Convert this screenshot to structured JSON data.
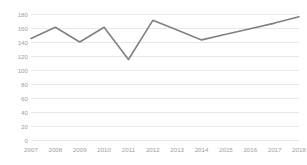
{
  "chart_data": {
    "type": "line",
    "title": "",
    "subtitle": "",
    "xlabel": "",
    "ylabel": "",
    "categories": [
      "2007",
      "2008",
      "2009",
      "2010",
      "2011",
      "2012",
      "2013",
      "2014",
      "2015",
      "2016",
      "2017",
      "2018"
    ],
    "values": [
      145,
      161,
      140,
      161,
      115,
      171,
      157,
      143,
      151,
      159,
      167,
      176
    ],
    "series": [
      {
        "name": "",
        "values": [
          145,
          161,
          140,
          161,
          115,
          171,
          157,
          143,
          151,
          159,
          167,
          176
        ]
      }
    ],
    "ylim": [
      0,
      180
    ],
    "xlim": [
      "2007",
      "2018"
    ],
    "yticks": [
      0,
      20,
      40,
      60,
      80,
      100,
      120,
      140,
      160,
      180
    ],
    "ytick_labels": [
      "0",
      "20",
      "40",
      "60",
      "80",
      "100",
      "120",
      "140",
      "160",
      "180"
    ],
    "xtick_labels": [
      "2007",
      "2008",
      "2009",
      "2010",
      "2011",
      "2012",
      "2013",
      "2014",
      "2015",
      "2016",
      "2017",
      "2018"
    ],
    "grid": true,
    "grid_axis": "y",
    "legend": false,
    "legend_position": "none",
    "markers": false,
    "annotations": [],
    "colors": {
      "line": "#808080",
      "gridline": "#e8e8e8",
      "tick_text": "#a0a0a0",
      "background": "#ffffff"
    },
    "line_width": 1.6
  }
}
